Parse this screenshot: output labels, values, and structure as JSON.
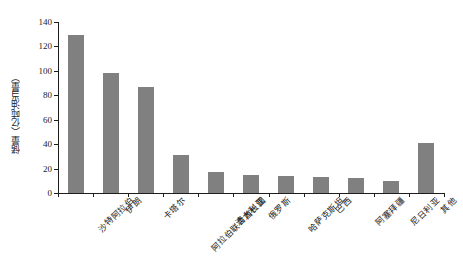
{
  "chart_data": {
    "type": "bar",
    "title": "",
    "xlabel": "",
    "ylabel": "储量（亿吨油当量）",
    "ylim": [
      0,
      140
    ],
    "yticks": [
      0,
      20,
      40,
      60,
      80,
      100,
      120,
      140
    ],
    "grid": false,
    "legend": null,
    "bar_color": "#808080",
    "axis_color": "#1d1d1d",
    "categories": [
      "沙特阿拉伯",
      "伊朗",
      "卡塔尔",
      "阿拉伯联合酋长国",
      "澳大利亚",
      "俄罗斯",
      "哈萨克斯坦",
      "巴西",
      "阿塞拜疆",
      "尼日利亚",
      "其他"
    ],
    "values": [
      129,
      98,
      86.5,
      31,
      17.5,
      15,
      14,
      13,
      12.5,
      10,
      41
    ]
  }
}
